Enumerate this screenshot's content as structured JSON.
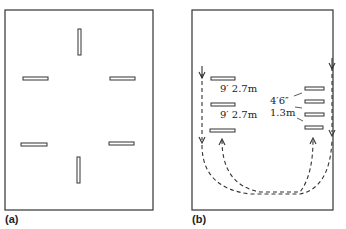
{
  "panels": [
    {
      "label": "(a)"
    },
    {
      "label": "(b)",
      "annotations": {
        "left_gap_1": "9′  2.7m",
        "left_gap_2": "9′  2.7m",
        "right_gap_imperial": "4′6″",
        "right_gap_metric": "1.3m"
      }
    }
  ],
  "colors": {
    "line": "#333333",
    "background": "#ffffff"
  }
}
